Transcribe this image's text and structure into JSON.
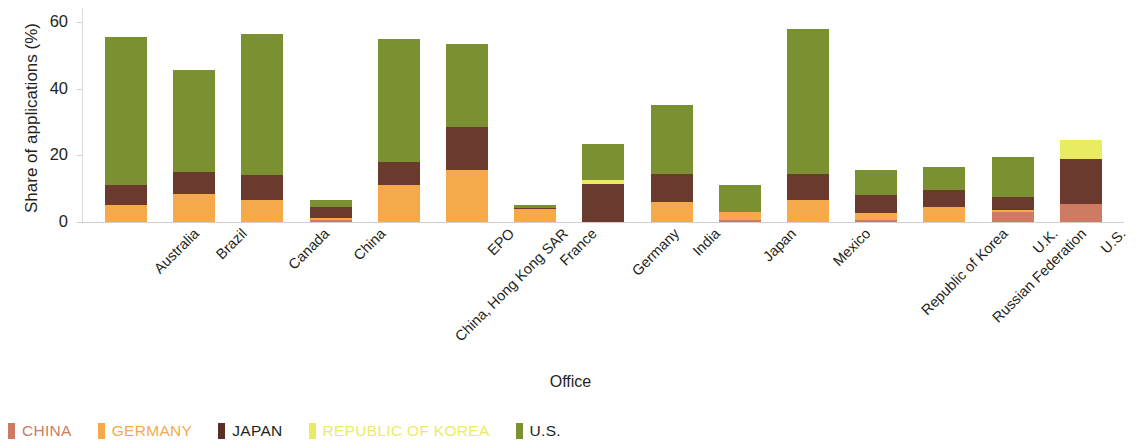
{
  "chart_data": {
    "type": "bar",
    "subtype": "stacked-bar",
    "title": "",
    "xlabel": "Office",
    "ylabel": "Share of applications (%)",
    "ylim": [
      0,
      62
    ],
    "yticks": [
      0,
      20,
      40,
      60
    ],
    "ytick_labels": [
      "0",
      "20",
      "40",
      "60"
    ],
    "grid": false,
    "legend_position": "bottom-left",
    "categories": [
      "Australia",
      "Brazil",
      "Canada",
      "China",
      "China, Hong Kong SAR",
      "EPO",
      "France",
      "Germany",
      "India",
      "Japan",
      "Mexico",
      "Republic of Korea",
      "Russian Federation",
      "U.K.",
      "U.S."
    ],
    "series": [
      {
        "name": "CHINA",
        "color": "#cd7b62",
        "values": [
          0,
          0,
          0,
          0.6,
          0,
          0,
          0,
          0,
          0,
          0.6,
          0,
          0.6,
          0,
          3.0,
          5.5
        ]
      },
      {
        "name": "GERMANY",
        "color": "#f6a94a",
        "values": [
          5.0,
          8.5,
          6.5,
          0.5,
          11.0,
          15.5,
          4.0,
          0,
          6.0,
          2.5,
          6.5,
          2.0,
          4.5,
          0.5,
          0
        ]
      },
      {
        "name": "JAPAN",
        "color": "#6b3a2e",
        "values": [
          6.0,
          6.5,
          7.5,
          3.5,
          7.0,
          13.0,
          0.3,
          11.5,
          8.5,
          0,
          8.0,
          5.5,
          5.0,
          4.0,
          13.5
        ]
      },
      {
        "name": "REPUBLIC OF KOREA",
        "color": "#e9ec63",
        "values": [
          0,
          0,
          0,
          0,
          0,
          0,
          0,
          1.0,
          0,
          0,
          0,
          0,
          0,
          0,
          5.5
        ]
      },
      {
        "name": "U.S.",
        "color": "#7b9131",
        "values": [
          44.5,
          30.5,
          42.5,
          2.0,
          37.0,
          25.0,
          0.7,
          11.0,
          20.5,
          8.0,
          43.5,
          7.5,
          7.0,
          12.0,
          0
        ]
      }
    ],
    "totals": [
      55.5,
      45.5,
      56.5,
      6.6,
      55.0,
      53.5,
      5.0,
      23.5,
      35.0,
      11.1,
      58.0,
      15.6,
      16.5,
      19.5,
      24.5
    ]
  },
  "legend": {
    "items": [
      {
        "label": "CHINA",
        "swatch": "#cd7b62",
        "text_color": "#cd7b62"
      },
      {
        "label": "GERMANY",
        "swatch": "#f6a94a",
        "text_color": "#f6a94a"
      },
      {
        "label": "JAPAN",
        "swatch": "#5a2f25",
        "text_color": "#231f20"
      },
      {
        "label": "REPUBLIC OF KOREA",
        "swatch": "#e9ec63",
        "text_color": "#e9ec63"
      },
      {
        "label": "U.S.",
        "swatch": "#7b9131",
        "text_color": "#231f20"
      }
    ]
  }
}
